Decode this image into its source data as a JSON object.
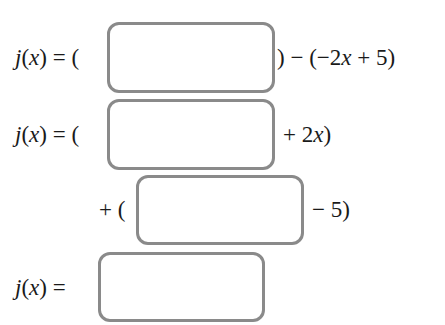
{
  "equations": {
    "row1": {
      "lhs": "j(x) = (",
      "rhs": ") − (−2x + 5)",
      "input_value": ""
    },
    "row2": {
      "lhs": "j(x) = (",
      "rhs": "+ 2x)",
      "input_value": ""
    },
    "row3": {
      "lhs": "+ (",
      "rhs": "− 5)",
      "input_value": ""
    },
    "row4": {
      "lhs": "j(x) =",
      "input_value": ""
    }
  },
  "colors": {
    "box_border": "#8a8a8a",
    "text": "#1a1a1a",
    "background": "#ffffff"
  }
}
